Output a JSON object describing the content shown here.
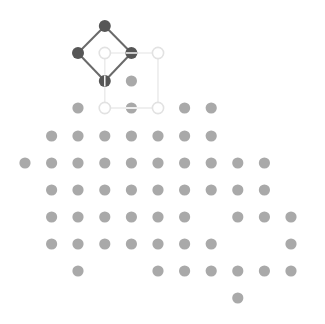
{
  "board": {
    "width": 325,
    "height": 324,
    "background": "#ffffff",
    "grid": {
      "col_x": [
        25,
        51.6,
        78,
        104.8,
        131.4,
        158,
        184.6,
        211.2,
        237.8,
        264.4,
        291
      ],
      "row_y": [
        26,
        53,
        81,
        108,
        136,
        163,
        190,
        217,
        244,
        271,
        298
      ],
      "dot_radius": 5.6
    },
    "colors": {
      "dot": "#a9a9a9",
      "active_node": "#565656",
      "active_edge": "#6a6a6a",
      "ghost_node_stroke": "#e2e2e2",
      "ghost_edge": "#ececec"
    },
    "dots": [
      {
        "r": 2,
        "c": 4
      },
      {
        "r": 3,
        "c": 2
      },
      {
        "r": 3,
        "c": 6
      },
      {
        "r": 3,
        "c": 7
      },
      {
        "r": 4,
        "c": 1
      },
      {
        "r": 4,
        "c": 2
      },
      {
        "r": 4,
        "c": 3
      },
      {
        "r": 4,
        "c": 4
      },
      {
        "r": 4,
        "c": 5
      },
      {
        "r": 4,
        "c": 6
      },
      {
        "r": 4,
        "c": 7
      },
      {
        "r": 5,
        "c": 0
      },
      {
        "r": 5,
        "c": 1
      },
      {
        "r": 5,
        "c": 2
      },
      {
        "r": 5,
        "c": 3
      },
      {
        "r": 5,
        "c": 4
      },
      {
        "r": 5,
        "c": 5
      },
      {
        "r": 5,
        "c": 6
      },
      {
        "r": 5,
        "c": 7
      },
      {
        "r": 5,
        "c": 8
      },
      {
        "r": 5,
        "c": 9
      },
      {
        "r": 6,
        "c": 1
      },
      {
        "r": 6,
        "c": 2
      },
      {
        "r": 6,
        "c": 3
      },
      {
        "r": 6,
        "c": 4
      },
      {
        "r": 6,
        "c": 5
      },
      {
        "r": 6,
        "c": 6
      },
      {
        "r": 6,
        "c": 7
      },
      {
        "r": 6,
        "c": 8
      },
      {
        "r": 6,
        "c": 9
      },
      {
        "r": 7,
        "c": 1
      },
      {
        "r": 7,
        "c": 2
      },
      {
        "r": 7,
        "c": 3
      },
      {
        "r": 7,
        "c": 4
      },
      {
        "r": 7,
        "c": 5
      },
      {
        "r": 7,
        "c": 6
      },
      {
        "r": 7,
        "c": 8
      },
      {
        "r": 7,
        "c": 9
      },
      {
        "r": 7,
        "c": 10
      },
      {
        "r": 8,
        "c": 1
      },
      {
        "r": 8,
        "c": 2
      },
      {
        "r": 8,
        "c": 3
      },
      {
        "r": 8,
        "c": 4
      },
      {
        "r": 8,
        "c": 5
      },
      {
        "r": 8,
        "c": 6
      },
      {
        "r": 8,
        "c": 7
      },
      {
        "r": 8,
        "c": 10
      },
      {
        "r": 9,
        "c": 2
      },
      {
        "r": 9,
        "c": 5
      },
      {
        "r": 9,
        "c": 6
      },
      {
        "r": 9,
        "c": 7
      },
      {
        "r": 9,
        "c": 8
      },
      {
        "r": 9,
        "c": 9
      },
      {
        "r": 9,
        "c": 10
      },
      {
        "r": 10,
        "c": 8
      }
    ],
    "active_shape": {
      "name": "diamond",
      "nodes": [
        {
          "r": 0,
          "c": 3,
          "mark": "none"
        },
        {
          "r": 1,
          "c": 2,
          "mark": "none"
        },
        {
          "r": 1,
          "c": 4,
          "mark": "horizontal"
        },
        {
          "r": 2,
          "c": 3,
          "mark": "vertical"
        }
      ],
      "edges": [
        [
          0,
          1
        ],
        [
          0,
          2
        ],
        [
          1,
          3
        ],
        [
          2,
          3
        ]
      ]
    },
    "ghost_shape": {
      "name": "square",
      "nodes": [
        {
          "r": 1,
          "c": 3,
          "fill": "hollow"
        },
        {
          "r": 1,
          "c": 5,
          "fill": "hollow"
        },
        {
          "r": 3,
          "c": 3,
          "fill": "hollow"
        },
        {
          "r": 3,
          "c": 5,
          "fill": "hollow"
        },
        {
          "r": 3,
          "c": 4,
          "fill": "striped"
        }
      ],
      "edges": [
        [
          0,
          1
        ],
        [
          0,
          2
        ],
        [
          1,
          3
        ],
        [
          2,
          4
        ],
        [
          4,
          3
        ]
      ]
    }
  }
}
